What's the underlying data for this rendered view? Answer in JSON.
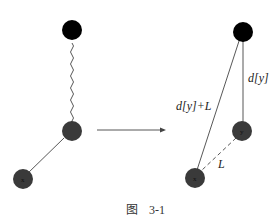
{
  "figure": {
    "caption_prefix": "图",
    "caption_number": "3-1"
  },
  "left_diagram": {
    "nodes": [
      {
        "id": "root",
        "label": "",
        "fill": "#000000"
      },
      {
        "id": "y",
        "label": "",
        "fill": "#3a3a3a"
      },
      {
        "id": "x",
        "label": "x",
        "fill": "#3a3a3a"
      }
    ],
    "edges": [
      {
        "from": "root",
        "to": "y",
        "style": "wavy"
      },
      {
        "from": "y",
        "to": "x",
        "style": "solid"
      }
    ]
  },
  "arrow": {
    "direction": "right"
  },
  "right_diagram": {
    "nodes": [
      {
        "id": "root",
        "label": "",
        "fill": "#000000"
      },
      {
        "id": "y",
        "label": "y",
        "fill": "#3a3a3a"
      },
      {
        "id": "x",
        "label": "x",
        "fill": "#3a3a3a"
      }
    ],
    "edges": [
      {
        "from": "root",
        "to": "y",
        "style": "solid",
        "label": "d[y]"
      },
      {
        "from": "root",
        "to": "x",
        "style": "solid",
        "label": "d[y]+L"
      },
      {
        "from": "y",
        "to": "x",
        "style": "dashed",
        "label": "L"
      }
    ]
  }
}
